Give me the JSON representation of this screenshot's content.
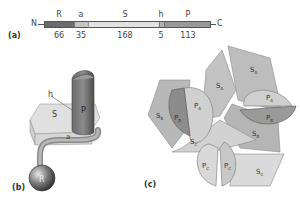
{
  "panel_a": {
    "label": "(a)",
    "n_terminus": "N",
    "c_terminus": "C",
    "segments": [
      {
        "name": "R",
        "length": "66",
        "color": "#6b6b6b"
      },
      {
        "name": "a",
        "length": "35",
        "color": "#c4c4c4"
      },
      {
        "name": "S",
        "length": "168",
        "color": "#e2e2e2"
      },
      {
        "name": "h",
        "length": "5",
        "color": "#b0b0b0"
      },
      {
        "name": "P",
        "length": "113",
        "color": "#999999"
      }
    ]
  },
  "panel_b": {
    "label": "(b)",
    "labels": {
      "h": "h",
      "S": "S",
      "P": "P",
      "a": "a",
      "R": "R"
    }
  },
  "panel_c": {
    "label": "(c)",
    "labels": {
      "SA_top": "S",
      "SA_top_sub": "A",
      "SA_mid": "S",
      "SA_mid_sub": "A",
      "SB_left": "S",
      "SB_left_sub": "B",
      "SB_right": "S",
      "SB_right_sub": "B",
      "SC_mid": "S",
      "SC_mid_sub": "C",
      "SC_right": "S",
      "SC_right_sub": "C",
      "PA_left": "P",
      "PA_left_sub": "A",
      "PB_left": "P",
      "PB_left_sub": "B",
      "PA_right": "P",
      "PA_right_sub": "A",
      "PB_right": "P",
      "PB_right_sub": "B",
      "PC_left": "P",
      "PC_left_sub": "C",
      "PC_right": "P",
      "PC_right_sub": "C"
    }
  }
}
